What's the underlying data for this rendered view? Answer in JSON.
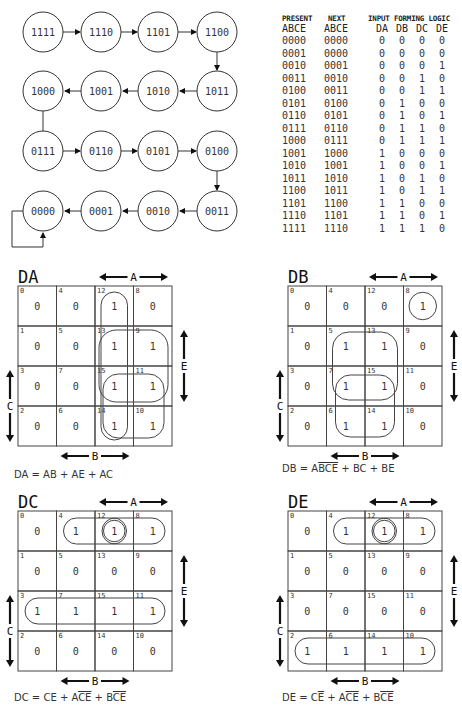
{
  "state_diagram": {
    "states": [
      {
        "label": "1111",
        "row": 0,
        "col": 0
      },
      {
        "label": "1110",
        "row": 0,
        "col": 1
      },
      {
        "label": "1101",
        "row": 0,
        "col": 2
      },
      {
        "label": "1100",
        "row": 0,
        "col": 3
      },
      {
        "label": "1000",
        "row": 1,
        "col": 0
      },
      {
        "label": "1001",
        "row": 1,
        "col": 1
      },
      {
        "label": "1010",
        "row": 1,
        "col": 2
      },
      {
        "label": "1011",
        "row": 1,
        "col": 3
      },
      {
        "label": "0111",
        "row": 2,
        "col": 0
      },
      {
        "label": "0110",
        "row": 2,
        "col": 1
      },
      {
        "label": "0101",
        "row": 2,
        "col": 2
      },
      {
        "label": "0100",
        "row": 2,
        "col": 3
      },
      {
        "label": "0000",
        "row": 3,
        "col": 0
      },
      {
        "label": "0001",
        "row": 3,
        "col": 1
      },
      {
        "label": "0010",
        "row": 3,
        "col": 2
      },
      {
        "label": "0011",
        "row": 3,
        "col": 3
      }
    ]
  },
  "truth_table": {
    "header_top": [
      "PRESENT",
      "NEXT",
      "INPUT FORMING LOGIC"
    ],
    "header_bottom": [
      "ABCE",
      "ABCE",
      "DA",
      "DB",
      "DC",
      "DE"
    ],
    "rows": [
      [
        "0000",
        "0000",
        "0",
        "0",
        "0",
        "0"
      ],
      [
        "0001",
        "0000",
        "0",
        "0",
        "0",
        "0"
      ],
      [
        "0010",
        "0001",
        "0",
        "0",
        "0",
        "1"
      ],
      [
        "0011",
        "0010",
        "0",
        "0",
        "1",
        "0"
      ],
      [
        "0100",
        "0011",
        "0",
        "0",
        "1",
        "1"
      ],
      [
        "0101",
        "0100",
        "0",
        "1",
        "0",
        "0"
      ],
      [
        "0110",
        "0101",
        "0",
        "1",
        "0",
        "1"
      ],
      [
        "0111",
        "0110",
        "0",
        "1",
        "1",
        "0"
      ],
      [
        "1000",
        "0111",
        "0",
        "1",
        "1",
        "1"
      ],
      [
        "1001",
        "1000",
        "1",
        "0",
        "0",
        "0"
      ],
      [
        "1010",
        "1001",
        "1",
        "0",
        "0",
        "1"
      ],
      [
        "1011",
        "1010",
        "1",
        "0",
        "1",
        "0"
      ],
      [
        "1100",
        "1011",
        "1",
        "0",
        "1",
        "1"
      ],
      [
        "1101",
        "1100",
        "1",
        "1",
        "0",
        "0"
      ],
      [
        "1110",
        "1101",
        "1",
        "1",
        "0",
        "1"
      ],
      [
        "1111",
        "1110",
        "1",
        "1",
        "1",
        "0"
      ]
    ]
  },
  "kmaps": [
    {
      "title": "DA",
      "axis_labels": {
        "top": "A",
        "right": "E",
        "left": "C",
        "bottom": "B"
      },
      "cell_numbers": [
        [
          "0",
          "4",
          "12",
          "8"
        ],
        [
          "1",
          "5",
          "13",
          "9"
        ],
        [
          "3",
          "7",
          "15",
          "11"
        ],
        [
          "2",
          "6",
          "14",
          "10"
        ]
      ],
      "values": [
        [
          "0",
          "0",
          "1",
          "0"
        ],
        [
          "0",
          "0",
          "1",
          "1"
        ],
        [
          "0",
          "0",
          "1",
          "1"
        ],
        [
          "0",
          "0",
          "1",
          "1"
        ]
      ],
      "equation": {
        "lhs": "DA",
        "terms": [
          [
            "AB"
          ],
          [
            "AE"
          ],
          [
            "AC"
          ]
        ]
      }
    },
    {
      "title": "DB",
      "axis_labels": {
        "top": "A",
        "right": "E",
        "left": "C",
        "bottom": "B"
      },
      "cell_numbers": [
        [
          "0",
          "4",
          "12",
          "8"
        ],
        [
          "1",
          "5",
          "13",
          "9"
        ],
        [
          "3",
          "7",
          "15",
          "11"
        ],
        [
          "2",
          "6",
          "14",
          "10"
        ]
      ],
      "values": [
        [
          "0",
          "0",
          "0",
          "1"
        ],
        [
          "0",
          "1",
          "1",
          "0"
        ],
        [
          "0",
          "1",
          "1",
          "0"
        ],
        [
          "0",
          "1",
          "1",
          "0"
        ]
      ],
      "equation": {
        "lhs": "DB",
        "terms": [
          [
            "A",
            "B̄C̄Ē"
          ],
          [
            "BC"
          ],
          [
            "BE"
          ]
        ]
      }
    },
    {
      "title": "DC",
      "axis_labels": {
        "top": "A",
        "right": "E",
        "left": "C",
        "bottom": "B"
      },
      "cell_numbers": [
        [
          "0",
          "4",
          "12",
          "8"
        ],
        [
          "1",
          "5",
          "13",
          "9"
        ],
        [
          "3",
          "7",
          "15",
          "11"
        ],
        [
          "2",
          "6",
          "14",
          "10"
        ]
      ],
      "values": [
        [
          "0",
          "1",
          "1",
          "1"
        ],
        [
          "0",
          "0",
          "0",
          "0"
        ],
        [
          "1",
          "1",
          "1",
          "1"
        ],
        [
          "0",
          "0",
          "0",
          "0"
        ]
      ],
      "equation": {
        "lhs": "DC",
        "terms": [
          [
            "CE"
          ],
          [
            "A",
            "C̄Ē"
          ],
          [
            "B",
            "C̄Ē"
          ]
        ]
      }
    },
    {
      "title": "DE",
      "axis_labels": {
        "top": "A",
        "right": "E",
        "left": "C",
        "bottom": "B"
      },
      "cell_numbers": [
        [
          "0",
          "4",
          "12",
          "8"
        ],
        [
          "1",
          "5",
          "13",
          "9"
        ],
        [
          "3",
          "7",
          "15",
          "11"
        ],
        [
          "2",
          "6",
          "14",
          "10"
        ]
      ],
      "values": [
        [
          "0",
          "1",
          "1",
          "1"
        ],
        [
          "0",
          "0",
          "0",
          "0"
        ],
        [
          "0",
          "0",
          "0",
          "0"
        ],
        [
          "1",
          "1",
          "1",
          "1"
        ]
      ],
      "equation": {
        "lhs": "DE",
        "terms": [
          [
            "C",
            "Ē"
          ],
          [
            "A",
            "C̄Ē"
          ],
          [
            "B",
            "C̄Ē"
          ]
        ]
      }
    }
  ],
  "equations_text": {
    "DA": "DA = AB + AE + AC",
    "DB": "DB = AB̄C̄Ē + BC + BE",
    "DC": "DC = CE + AC̄Ē + BC̄Ē",
    "DE": "DE = CĒ + AC̄Ē + BC̄Ē"
  }
}
